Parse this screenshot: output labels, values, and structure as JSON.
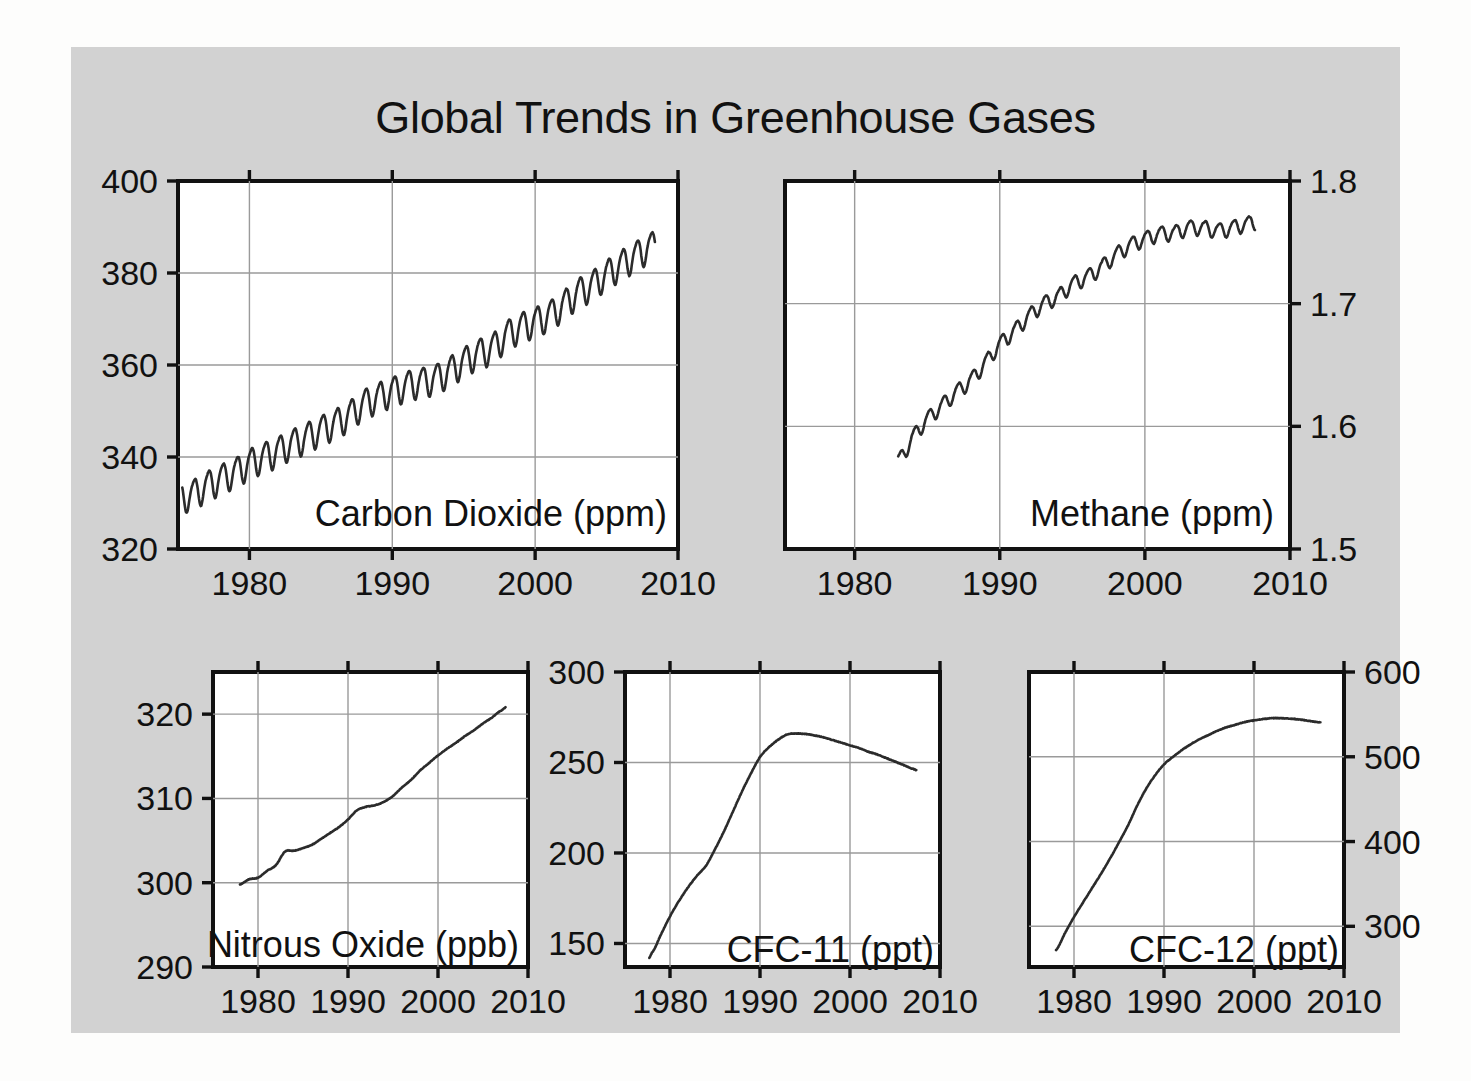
{
  "title": "Global Trends in Greenhouse Gases",
  "background_color": "#d2d2d2",
  "plot_background_color": "#ffffff",
  "line_color": "#2b2b2b",
  "grid_color": "#9a9a9a",
  "chart_data": [
    {
      "type": "line",
      "name": "carbon-dioxide",
      "title": "Carbon Dioxide (ppm)",
      "xlabel": "",
      "ylabel": "",
      "unit": "ppm",
      "xlim": [
        1975,
        2010
      ],
      "ylim": [
        320,
        400
      ],
      "xticks": [
        1980,
        1990,
        2000,
        2010
      ],
      "yticks": [
        320,
        340,
        360,
        380,
        400
      ],
      "xtick_labels": [
        "1980",
        "1990",
        "2000",
        "2010"
      ],
      "ytick_labels": [
        "320",
        "340",
        "360",
        "380",
        "400"
      ],
      "yaxis_side": "left",
      "grid": true,
      "seasonal_amplitude": 3.2,
      "x": [
        1975.0,
        1976.0,
        1977.0,
        1978.0,
        1979.0,
        1980.0,
        1981.0,
        1982.0,
        1983.0,
        1984.0,
        1985.0,
        1986.0,
        1987.0,
        1988.0,
        1989.0,
        1990.0,
        1991.0,
        1992.0,
        1993.0,
        1994.0,
        1995.0,
        1996.0,
        1997.0,
        1998.0,
        1999.0,
        2000.0,
        2001.0,
        2002.0,
        2003.0,
        2004.0,
        2005.0,
        2006.0,
        2007.0,
        2008.0
      ],
      "values": [
        331.1,
        332.0,
        333.8,
        335.4,
        336.8,
        338.7,
        340.1,
        341.4,
        343.0,
        344.4,
        346.0,
        347.4,
        349.2,
        351.6,
        353.1,
        354.4,
        355.6,
        356.4,
        357.1,
        358.8,
        360.8,
        362.6,
        363.8,
        366.6,
        368.3,
        369.5,
        371.0,
        373.2,
        375.8,
        377.5,
        379.8,
        381.9,
        383.8,
        385.6
      ],
      "series_start": 1975.3,
      "series_end": 2008.4,
      "value_start": 331.0,
      "value_end": 383.2
    },
    {
      "type": "line",
      "name": "methane",
      "title": "Methane (ppm)",
      "xlabel": "",
      "ylabel": "",
      "unit": "ppm",
      "xlim": [
        1975.2,
        2010
      ],
      "ylim": [
        1.5,
        1.8
      ],
      "xticks": [
        1980,
        1990,
        2000,
        2010
      ],
      "yticks": [
        1.5,
        1.6,
        1.7,
        1.8
      ],
      "xtick_labels": [
        "1980",
        "1990",
        "2000",
        "2010"
      ],
      "ytick_labels": [
        "1.5",
        "1.6",
        "1.7",
        "1.8"
      ],
      "yaxis_side": "right",
      "grid": true,
      "seasonal_amplitude": 0.006,
      "x": [
        1983.0,
        1984.0,
        1985.0,
        1986.0,
        1987.0,
        1988.0,
        1989.0,
        1990.0,
        1991.0,
        1992.0,
        1993.0,
        1994.0,
        1995.0,
        1996.0,
        1997.0,
        1998.0,
        1999.0,
        2000.0,
        2001.0,
        2002.0,
        2003.0,
        2004.0,
        2005.0,
        2006.0,
        2007.0
      ],
      "values": [
        1.572,
        1.591,
        1.606,
        1.617,
        1.628,
        1.638,
        1.652,
        1.667,
        1.678,
        1.69,
        1.7,
        1.706,
        1.716,
        1.722,
        1.73,
        1.74,
        1.748,
        1.753,
        1.757,
        1.758,
        1.762,
        1.762,
        1.76,
        1.762,
        1.765
      ],
      "series_start": 1983.0,
      "series_end": 2007.6,
      "value_start": 1.568,
      "value_end": 1.772
    },
    {
      "type": "line",
      "name": "nitrous-oxide",
      "title": "Nitrous Oxide (ppb)",
      "xlabel": "",
      "ylabel": "",
      "unit": "ppb",
      "xlim": [
        1975,
        2010
      ],
      "ylim": [
        290,
        325
      ],
      "xticks": [
        1980,
        1990,
        2000,
        2010
      ],
      "yticks": [
        290,
        300,
        310,
        320
      ],
      "xtick_labels": [
        "1980",
        "1990",
        "2000",
        "2010"
      ],
      "ytick_labels": [
        "290",
        "300",
        "310",
        "320"
      ],
      "yaxis_side": "left",
      "grid": true,
      "x": [
        1978.0,
        1979.0,
        1980.0,
        1981.0,
        1982.0,
        1983.0,
        1984.0,
        1985.0,
        1986.0,
        1987.0,
        1988.0,
        1989.0,
        1990.0,
        1991.0,
        1992.0,
        1993.0,
        1994.0,
        1995.0,
        1996.0,
        1997.0,
        1998.0,
        1999.0,
        2000.0,
        2001.0,
        2002.0,
        2003.0,
        2004.0,
        2005.0,
        2006.0,
        2007.0
      ],
      "values": [
        299.8,
        300.4,
        300.6,
        301.4,
        302.1,
        303.7,
        303.8,
        304.1,
        304.5,
        305.2,
        305.9,
        306.6,
        307.5,
        308.6,
        309.0,
        309.2,
        309.6,
        310.3,
        311.3,
        312.2,
        313.3,
        314.2,
        315.1,
        315.9,
        316.6,
        317.4,
        318.1,
        318.9,
        319.6,
        320.4
      ],
      "series_start": 1978.0,
      "series_end": 2007.5,
      "value_start": 299.8,
      "value_end": 320.5
    },
    {
      "type": "line",
      "name": "cfc-11",
      "title": "CFC-11 (ppt)",
      "xlabel": "",
      "ylabel": "",
      "unit": "ppt",
      "xlim": [
        1975,
        2010
      ],
      "ylim": [
        137,
        300
      ],
      "xticks": [
        1980,
        1990,
        2000,
        2010
      ],
      "yticks": [
        150,
        200,
        250,
        300
      ],
      "xtick_labels": [
        "1980",
        "1990",
        "2000",
        "2010"
      ],
      "ytick_labels": [
        "150",
        "200",
        "250",
        "300"
      ],
      "yaxis_side": "left",
      "grid": true,
      "x": [
        1978.0,
        1979.0,
        1980.0,
        1981.0,
        1982.0,
        1983.0,
        1984.0,
        1985.0,
        1986.0,
        1987.0,
        1988.0,
        1989.0,
        1990.0,
        1991.0,
        1992.0,
        1993.0,
        1994.0,
        1995.0,
        1996.0,
        1997.0,
        1998.0,
        1999.0,
        2000.0,
        2001.0,
        2002.0,
        2003.0,
        2004.0,
        2005.0,
        2006.0,
        2007.0
      ],
      "values": [
        145.0,
        155.0,
        165.0,
        173.5,
        181.0,
        187.5,
        193.0,
        202.0,
        212.0,
        223.0,
        234.0,
        244.0,
        253.0,
        258.5,
        262.5,
        265.5,
        266.0,
        265.8,
        265.0,
        264.0,
        262.5,
        261.0,
        259.5,
        258.0,
        256.0,
        254.5,
        252.5,
        250.5,
        248.5,
        246.5
      ],
      "series_start": 1977.7,
      "series_end": 2007.4,
      "value_start": 145.0,
      "value_end": 246.0
    },
    {
      "type": "line",
      "name": "cfc-12",
      "title": "CFC-12 (ppt)",
      "xlabel": "",
      "ylabel": "",
      "unit": "ppt",
      "xlim": [
        1975,
        2010
      ],
      "ylim": [
        252,
        600
      ],
      "xticks": [
        1980,
        1990,
        2000,
        2010
      ],
      "yticks": [
        300,
        400,
        500,
        600
      ],
      "xtick_labels": [
        "1980",
        "1990",
        "2000",
        "2010"
      ],
      "ytick_labels": [
        "300",
        "400",
        "500",
        "600"
      ],
      "yaxis_side": "right",
      "grid": true,
      "x": [
        1978.0,
        1979.0,
        1980.0,
        1981.0,
        1982.0,
        1983.0,
        1984.0,
        1985.0,
        1986.0,
        1987.0,
        1988.0,
        1989.0,
        1990.0,
        1991.0,
        1992.0,
        1993.0,
        1994.0,
        1995.0,
        1996.0,
        1997.0,
        1998.0,
        1999.0,
        2000.0,
        2001.0,
        2002.0,
        2003.0,
        2004.0,
        2005.0,
        2006.0,
        2007.0
      ],
      "values": [
        272.0,
        292.0,
        311.0,
        328.0,
        345.0,
        362.0,
        380.0,
        399.0,
        419.0,
        442.0,
        462.0,
        478.0,
        491.0,
        500.0,
        508.0,
        515.0,
        521.0,
        526.0,
        531.0,
        535.0,
        538.0,
        541.0,
        543.0,
        544.5,
        545.5,
        545.5,
        545.0,
        544.0,
        542.5,
        541.0
      ],
      "series_start": 1978.0,
      "series_end": 2007.4,
      "value_start": 270.0,
      "value_end": 541.0
    }
  ]
}
